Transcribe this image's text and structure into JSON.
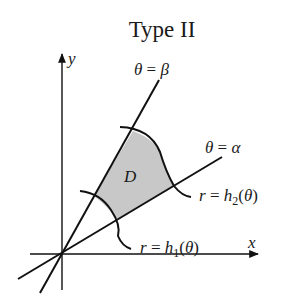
{
  "title": "Type II",
  "axes": {
    "x_label": "x",
    "y_label": "y"
  },
  "rays": {
    "upper": {
      "theta": "θ",
      "eq": " = ",
      "value": "β"
    },
    "lower": {
      "theta": "θ",
      "eq": " = ",
      "value": "α"
    }
  },
  "curves": {
    "inner": {
      "r": "r",
      "eq": " = ",
      "h": "h",
      "sub": "1",
      "open": "(",
      "theta": "θ",
      "close": ")"
    },
    "outer": {
      "r": "r",
      "eq": " = ",
      "h": "h",
      "sub": "2",
      "open": "(",
      "theta": "θ",
      "close": ")"
    }
  },
  "region": {
    "label": "D",
    "fill_color": "#c8c8c8"
  },
  "colors": {
    "stroke": "#111111",
    "background": "#ffffff"
  }
}
